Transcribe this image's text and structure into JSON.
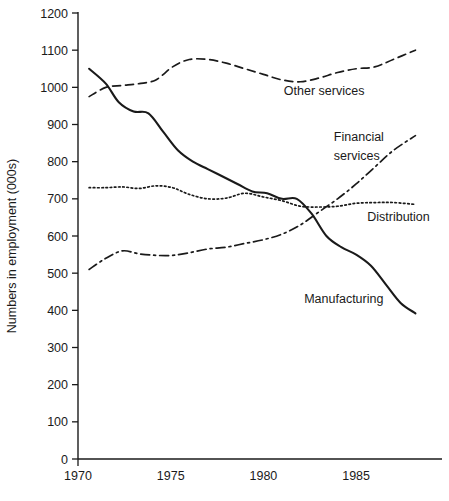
{
  "chart_data": {
    "type": "line",
    "title": "",
    "xlabel": "",
    "ylabel": "Numbers in employment (000s)",
    "xlim": [
      1970,
      1988.5
    ],
    "ylim": [
      0,
      1200
    ],
    "grid": false,
    "legend_position": "inline-annotations",
    "x_ticks": [
      "1970",
      "1975",
      "1980",
      "1985"
    ],
    "x_tick_values": [
      1970,
      1975,
      1980,
      1985
    ],
    "y_ticks": [
      "0",
      "100",
      "200",
      "300",
      "400",
      "500",
      "600",
      "700",
      "800",
      "900",
      "1000",
      "1100",
      "1200"
    ],
    "y_tick_values": [
      0,
      100,
      200,
      300,
      400,
      500,
      600,
      700,
      800,
      900,
      1000,
      1100,
      1200
    ],
    "series": [
      {
        "name": "Manufacturing",
        "style": "solid",
        "x": [
          1970.6,
          1971.5,
          1972.2,
          1973.0,
          1973.8,
          1974.6,
          1975.4,
          1976.2,
          1977.0,
          1977.8,
          1978.6,
          1979.4,
          1980.2,
          1981.0,
          1981.8,
          1982.6,
          1983.4,
          1984.2,
          1985.0,
          1985.8,
          1986.6,
          1987.4,
          1988.2
        ],
        "values": [
          1050,
          1010,
          960,
          935,
          930,
          880,
          830,
          800,
          780,
          760,
          740,
          720,
          715,
          700,
          700,
          660,
          600,
          570,
          550,
          520,
          470,
          420,
          392
        ]
      },
      {
        "name": "Other services",
        "style": "dashed",
        "x": [
          1970.6,
          1971.5,
          1972.4,
          1973.3,
          1974.2,
          1975.1,
          1976.0,
          1977.0,
          1978.0,
          1979.0,
          1980.0,
          1981.0,
          1982.0,
          1983.0,
          1984.0,
          1985.0,
          1986.0,
          1987.0,
          1988.2
        ],
        "values": [
          975,
          1000,
          1005,
          1010,
          1020,
          1055,
          1075,
          1075,
          1065,
          1050,
          1035,
          1020,
          1015,
          1025,
          1040,
          1050,
          1055,
          1075,
          1100
        ]
      },
      {
        "name": "Distribution",
        "style": "dotted",
        "x": [
          1970.6,
          1971.5,
          1972.4,
          1973.3,
          1974.2,
          1975.1,
          1976.0,
          1977.0,
          1978.0,
          1979.0,
          1980.0,
          1981.0,
          1982.0,
          1983.0,
          1984.0,
          1985.0,
          1986.0,
          1987.0,
          1988.2
        ],
        "values": [
          730,
          730,
          732,
          728,
          735,
          730,
          712,
          700,
          702,
          715,
          705,
          695,
          680,
          678,
          680,
          688,
          690,
          690,
          685
        ]
      },
      {
        "name": "Financial services",
        "style": "dashdot",
        "x": [
          1970.6,
          1971.5,
          1972.4,
          1973.3,
          1974.2,
          1975.1,
          1976.0,
          1977.0,
          1978.0,
          1979.0,
          1980.0,
          1981.0,
          1982.0,
          1983.0,
          1984.0,
          1985.0,
          1986.0,
          1987.0,
          1988.2
        ],
        "values": [
          510,
          540,
          560,
          552,
          548,
          548,
          555,
          565,
          570,
          580,
          590,
          605,
          630,
          665,
          700,
          740,
          785,
          830,
          870
        ]
      }
    ],
    "annotations": [
      {
        "text": "Other services",
        "x": 1981.1,
        "y": 980
      },
      {
        "text": "Financial",
        "x": 1983.8,
        "y": 855
      },
      {
        "text": "services",
        "x": 1983.8,
        "y": 805
      },
      {
        "text": "Distribution",
        "x": 1985.6,
        "y": 640
      },
      {
        "text": "Manufacturing",
        "x": 1982.2,
        "y": 420
      }
    ]
  },
  "colors": {
    "ink": "#1a1a1a",
    "background": "#ffffff"
  }
}
